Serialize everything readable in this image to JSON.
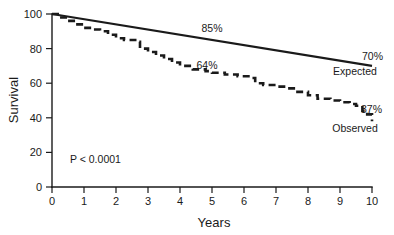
{
  "chart_data": {
    "type": "line",
    "title": "",
    "subtitle": "",
    "xlabel": "Years",
    "ylabel": "Survival",
    "xlim": [
      0,
      10
    ],
    "ylim": [
      0,
      100
    ],
    "xticks": [
      "0",
      "1",
      "2",
      "3",
      "4",
      "5",
      "6",
      "7",
      "8",
      "9",
      "10"
    ],
    "yticks": [
      "0",
      "20",
      "40",
      "60",
      "80",
      "100"
    ],
    "grid": false,
    "legend_position": "inline-right",
    "series": [
      {
        "name": "Expected",
        "style": "solid",
        "x": [
          0,
          10
        ],
        "values": [
          100,
          70
        ]
      },
      {
        "name": "Observed",
        "style": "dashed-step",
        "x": [
          0,
          0.25,
          0.5,
          0.75,
          1.0,
          1.25,
          1.5,
          1.75,
          2.0,
          2.25,
          2.4,
          2.6,
          2.75,
          3.0,
          3.25,
          3.5,
          3.75,
          4.0,
          4.4,
          4.8,
          5.0,
          5.4,
          5.8,
          6.0,
          6.2,
          6.35,
          6.6,
          7.0,
          7.3,
          7.6,
          8.0,
          8.3,
          8.7,
          9.0,
          9.3,
          9.5,
          9.7,
          9.85,
          10.0
        ],
        "values": [
          100,
          98,
          96,
          94,
          92,
          91,
          90,
          88,
          86,
          85,
          85,
          84,
          80,
          78,
          76,
          74,
          72,
          70,
          68,
          67,
          66,
          65,
          64,
          64,
          63,
          60,
          59,
          58,
          57,
          55,
          53,
          51,
          50,
          49,
          48,
          47,
          44,
          42,
          38
        ]
      }
    ],
    "annotations": [
      {
        "id": "expected-mid-label",
        "text": "85%",
        "x": 4.55,
        "y": 85,
        "series": "Expected"
      },
      {
        "id": "expected-end-label",
        "text": "70%",
        "x": 10.0,
        "y": 70,
        "series": "Expected"
      },
      {
        "id": "observed-mid-label",
        "text": "64%",
        "x": 4.8,
        "y": 64,
        "series": "Observed"
      },
      {
        "id": "observed-end-label",
        "text": "37%",
        "x": 10.0,
        "y": 37,
        "series": "Observed"
      },
      {
        "id": "p-value",
        "text": "P < 0.0001",
        "x": 0.7,
        "y": 17
      }
    ]
  },
  "labels": {
    "y_axis_title": "Survival",
    "x_axis_title": "Years",
    "p_value": "P < 0.0001",
    "expected_series_name": "Expected",
    "observed_series_name": "Observed",
    "expected_mid_pct": "85%",
    "expected_end_pct": "70%",
    "observed_mid_pct": "64%",
    "observed_end_pct": "37%"
  },
  "yticks": {
    "t0": "0",
    "t20": "20",
    "t40": "40",
    "t60": "60",
    "t80": "80",
    "t100": "100"
  },
  "xticks": {
    "t0": "0",
    "t1": "1",
    "t2": "2",
    "t3": "3",
    "t4": "4",
    "t5": "5",
    "t6": "6",
    "t7": "7",
    "t8": "8",
    "t9": "9",
    "t10": "10"
  },
  "colors": {
    "ink": "#1a1a1a",
    "background": "#ffffff"
  }
}
